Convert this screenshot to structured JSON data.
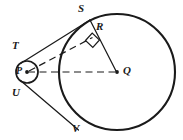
{
  "figure": {
    "background_color": "#ffffff",
    "stroke_color": "#1a1a1a",
    "labels": {
      "S": "S",
      "R": "R",
      "T": "T",
      "P": "P",
      "U": "U",
      "Q": "Q",
      "V": "V"
    },
    "shapes": {
      "large_circle": {
        "name": "circle-Q",
        "cx": 117,
        "cy": 72,
        "r": 58
      },
      "small_circle": {
        "name": "circle-P",
        "cx": 27,
        "cy": 72,
        "r": 11
      },
      "center_point_P": {
        "cx": 27,
        "cy": 72,
        "r": 1.8
      },
      "center_point_Q": {
        "cx": 117,
        "cy": 72,
        "r": 1.8
      },
      "right_angle_marker": {
        "name": "right-angle-square",
        "x": 85,
        "y": 33,
        "size": 13
      }
    },
    "segments": {
      "tangent_upper": {
        "name": "tangent-P-S",
        "x1": 21,
        "y1": 63,
        "x2": 90,
        "y2": 20
      },
      "tangent_lower": {
        "name": "tangent-P-V",
        "x1": 21,
        "y1": 81,
        "x2": 78,
        "y2": 130
      },
      "radius_QS": {
        "name": "segment-Q-S",
        "x1": 117,
        "y1": 72,
        "x2": 90,
        "y2": 20
      },
      "dashed_PQ": {
        "name": "dashed-P-Q",
        "x1": 27,
        "y1": 72,
        "x2": 115,
        "y2": 72
      },
      "dashed_PR": {
        "name": "dashed-P-R",
        "x1": 27,
        "y1": 72,
        "x2": 92,
        "y2": 38
      }
    },
    "label_positions": {
      "S": {
        "x": 78,
        "y": 4
      },
      "R": {
        "x": 96,
        "y": 22
      },
      "T": {
        "x": 13,
        "y": 41
      },
      "P": {
        "x": 17,
        "y": 66
      },
      "U": {
        "x": 13,
        "y": 88
      },
      "Q": {
        "x": 123,
        "y": 66
      },
      "V": {
        "x": 73,
        "y": 124
      }
    }
  }
}
